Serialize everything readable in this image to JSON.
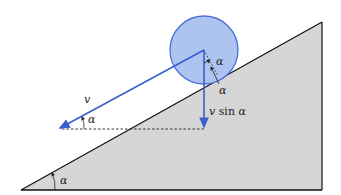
{
  "diagram": {
    "colors": {
      "incline_fill": "#d6d6d6",
      "incline_stroke": "#111111",
      "ball_fill": "#aec4f0",
      "ball_stroke": "#4a6fd6",
      "vector": "#3a5fcd",
      "dashed": "#222222",
      "label": "#222222"
    },
    "labels": {
      "velocity": "v",
      "vertical_component_v": "v",
      "vertical_component_rest": " sin ",
      "vertical_component_alpha": "α",
      "angle_velocity": "α",
      "angle_ball_upper": "α",
      "angle_ball_lower": "α",
      "angle_incline": "α"
    }
  }
}
